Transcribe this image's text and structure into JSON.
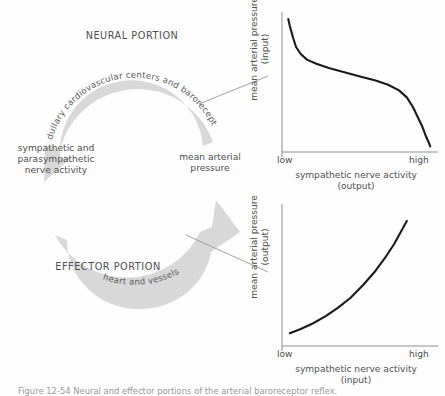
{
  "figure": {
    "caption": "Figure 12-54  Neural and effector portions of the arterial baroreceptor reflex."
  },
  "diagram": {
    "neural_portion_label": "NEURAL PORTION",
    "effector_portion_label": "EFFECTOR PORTION",
    "top_arc_text": "medullary cardiovascular centers and baroreceptors",
    "bottom_arc_text": "heart and vessels",
    "left_node_label": "sympathetic and\nparasympathetic\nnerve activity",
    "right_node_label": "mean arterial\npressure",
    "arrow_color": "#d7d7d7",
    "arrow_text_color": "#5c5c5c",
    "leader_line_color": "#8a8a8a"
  },
  "chart_data": [
    {
      "id": "neural-portion-chart",
      "type": "line",
      "title": "",
      "xlabel": "sympathetic nerve activity\n(output)",
      "ylabel": "mean arterial pressure\n(input)",
      "xticklabels": [
        "low",
        "high"
      ],
      "yticklabels": [],
      "xlim": [
        0,
        1
      ],
      "ylim": [
        0,
        1
      ],
      "grid": false,
      "legend": "none",
      "line_color": "#1a1a1a",
      "axis_color": "#8d8d8d",
      "series": [
        {
          "name": "baroreceptor input-output",
          "x": [
            0.04,
            0.05,
            0.07,
            0.09,
            0.12,
            0.16,
            0.22,
            0.3,
            0.4,
            0.5,
            0.6,
            0.68,
            0.75,
            0.8,
            0.84,
            0.87,
            0.9,
            0.92,
            0.94,
            0.95
          ],
          "y": [
            0.95,
            0.9,
            0.82,
            0.75,
            0.7,
            0.66,
            0.63,
            0.6,
            0.57,
            0.54,
            0.51,
            0.48,
            0.44,
            0.39,
            0.32,
            0.25,
            0.18,
            0.12,
            0.07,
            0.04
          ]
        }
      ]
    },
    {
      "id": "effector-portion-chart",
      "type": "line",
      "title": "",
      "xlabel": "sympathetic nerve activity\n(input)",
      "ylabel": "mean arterial pressure\n(output)",
      "xticklabels": [
        "low",
        "high"
      ],
      "yticklabels": [],
      "xlim": [
        0,
        1
      ],
      "ylim": [
        0,
        1
      ],
      "grid": false,
      "legend": "none",
      "line_color": "#1a1a1a",
      "axis_color": "#8d8d8d",
      "series": [
        {
          "name": "effector input-output",
          "x": [
            0.05,
            0.12,
            0.2,
            0.28,
            0.36,
            0.44,
            0.52,
            0.6,
            0.66,
            0.72,
            0.77,
            0.8
          ],
          "y": [
            0.09,
            0.12,
            0.16,
            0.21,
            0.27,
            0.34,
            0.43,
            0.53,
            0.62,
            0.72,
            0.82,
            0.88
          ]
        }
      ]
    }
  ]
}
